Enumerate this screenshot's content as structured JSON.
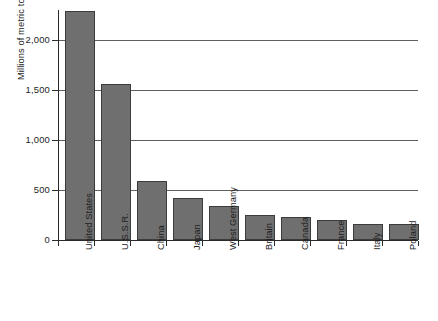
{
  "chart_data": {
    "type": "bar",
    "title": "",
    "xlabel": "",
    "ylabel": "Millions of metric tons coal equivalent",
    "categories": [
      "United States",
      "U.S.S.R.",
      "China",
      "Japan",
      "West Germany",
      "Britain",
      "Canada",
      "France",
      "Italy",
      "Poland"
    ],
    "values": [
      2290,
      1560,
      590,
      425,
      340,
      250,
      235,
      205,
      165,
      165
    ],
    "ylim": [
      0,
      2300
    ],
    "yticks": [
      0,
      500,
      1000,
      1500,
      2000
    ],
    "ytick_labels": [
      "0",
      "500",
      "1,000",
      "1,500",
      "2,000"
    ],
    "grid": true,
    "legend": false,
    "bar_color": "#6f6f6f",
    "bar_border_color": "#3c3c3c",
    "gridline_color": "#606060",
    "axis_color": "#2b2b2b",
    "background": "#ffffff"
  }
}
